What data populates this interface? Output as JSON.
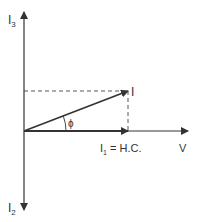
{
  "diagram": {
    "type": "phasor-diagram",
    "labels": {
      "i3": "I",
      "i3_sub": "3",
      "i2": "I",
      "i2_sub": "2",
      "i": "I",
      "phi": "ϕ",
      "i1": "I",
      "i1_sub": "1",
      "i1_eq": " = H.C.",
      "v": "V"
    },
    "colors": {
      "line": "#333333",
      "text": "#333333",
      "background": "#ffffff"
    }
  }
}
